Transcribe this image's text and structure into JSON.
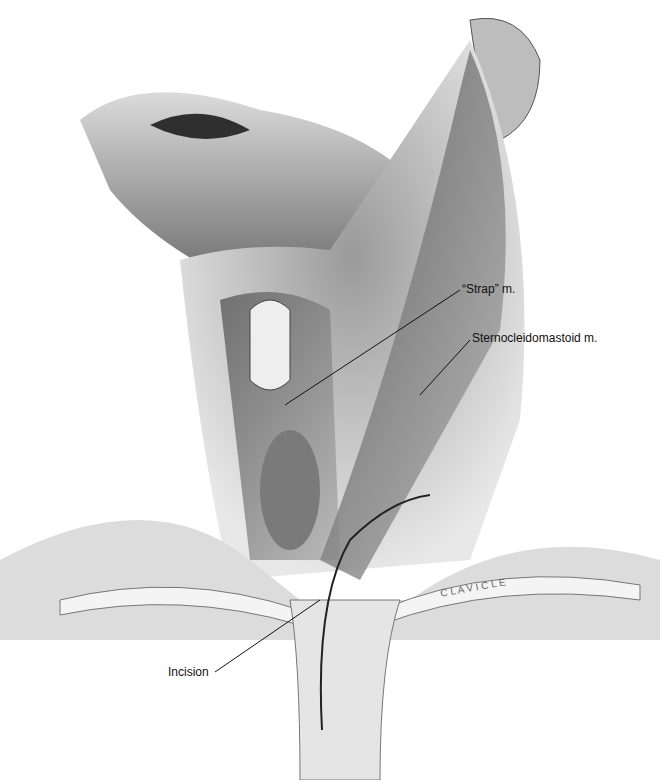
{
  "figure": {
    "labels": {
      "strap": "“Strap” m.",
      "scm": "Sternocleidomastoid m.",
      "incision": "Incision",
      "clavicle": "C L A V I C L E"
    }
  }
}
